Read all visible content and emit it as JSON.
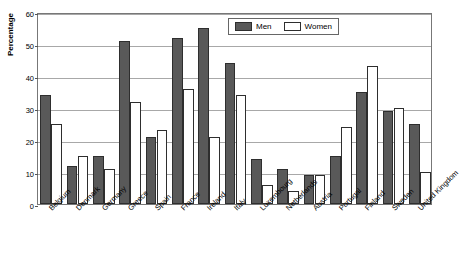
{
  "chart_data": {
    "type": "bar",
    "title": "",
    "xlabel": "",
    "ylabel": "Percentage",
    "ylim": [
      0,
      60
    ],
    "yticks": [
      0,
      10,
      20,
      30,
      40,
      50,
      60
    ],
    "grid": true,
    "legend_position": "top-right-inside",
    "categories": [
      "Belgium",
      "Denmark",
      "Germany",
      "Greece",
      "Spain",
      "France",
      "Ireland",
      "Italy",
      "Luxembourg",
      "Netherlands",
      "Austria",
      "Portugal",
      "Finland",
      "Sweden",
      "United Kingdom"
    ],
    "series": [
      {
        "name": "Men",
        "color": "#595959",
        "values": [
          34,
          12,
          15,
          51,
          21,
          52,
          55,
          44,
          14,
          11,
          9,
          15,
          35,
          29,
          25
        ]
      },
      {
        "name": "Women",
        "color": "#ffffff",
        "values": [
          25,
          15,
          11,
          32,
          23,
          36,
          21,
          34,
          6,
          4,
          9,
          24,
          43,
          30,
          10
        ]
      }
    ]
  },
  "legend": {
    "men_label": "Men",
    "women_label": "Women"
  },
  "axis": {
    "y_title": "Percentage"
  }
}
